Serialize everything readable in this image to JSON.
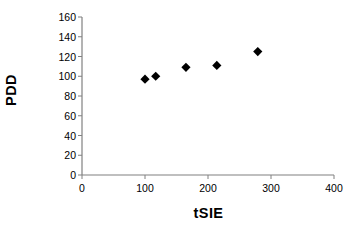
{
  "chart_data": {
    "type": "scatter",
    "title": "",
    "xlabel": "tSIE",
    "ylabel": "PDD",
    "xlim": [
      0,
      400
    ],
    "ylim": [
      0,
      160
    ],
    "xticks": [
      0,
      100,
      200,
      300,
      400
    ],
    "yticks": [
      0,
      20,
      40,
      60,
      80,
      100,
      120,
      140,
      160
    ],
    "grid": false,
    "legend": false,
    "marker": "diamond",
    "marker_color": "#000000",
    "series": [
      {
        "name": "PDD vs tSIE",
        "points": [
          {
            "x": 100,
            "y": 97
          },
          {
            "x": 117,
            "y": 100
          },
          {
            "x": 165,
            "y": 109
          },
          {
            "x": 214,
            "y": 111
          },
          {
            "x": 279,
            "y": 125
          }
        ]
      }
    ]
  },
  "axis": {
    "line_color": "#808080",
    "text_color": "#000000"
  }
}
